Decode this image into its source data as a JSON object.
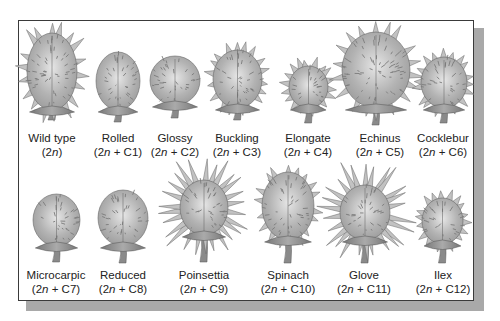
{
  "figure": {
    "colors": {
      "frame_border": "#3a3a3a",
      "shadow": "#a9a9a9",
      "pod_fill": "#9a9a9a",
      "pod_highlight": "#e6e6e6",
      "spine": "#7a7a7a",
      "stem": "#8a8a8a"
    },
    "rows": [
      {
        "items": [
          {
            "name": "Wild type",
            "karyotype_prefix": "(2",
            "karyotype_n": "n",
            "karyotype_suffix": ")",
            "x": 52,
            "body": [
              27,
              33,
              77,
              110
            ],
            "spiny": "large",
            "stem_to": 120
          },
          {
            "name": "Rolled",
            "karyotype_prefix": "(2",
            "karyotype_n": "n",
            "karyotype_suffix": " + C1)",
            "x": 118,
            "body": [
              96,
              52,
              140,
              110
            ],
            "spiny": "small",
            "stem_to": 122
          },
          {
            "name": "Glossy",
            "karyotype_prefix": "(2",
            "karyotype_n": "n",
            "karyotype_suffix": " + C2)",
            "x": 175,
            "body": [
              150,
              56,
              200,
              105
            ],
            "spiny": "small",
            "stem_to": 118
          },
          {
            "name": "Buckling",
            "karyotype_prefix": "(2",
            "karyotype_n": "n",
            "karyotype_suffix": " + C3)",
            "x": 237,
            "body": [
              213,
              50,
              262,
              108
            ],
            "spiny": "medium",
            "stem_to": 120
          },
          {
            "name": "Elongate",
            "karyotype_prefix": "(2",
            "karyotype_n": "n",
            "karyotype_suffix": " + C4)",
            "x": 308,
            "body": [
              289,
              66,
              328,
              108
            ],
            "spiny": "medium",
            "stem_to": 123
          },
          {
            "name": "Echinus",
            "karyotype_prefix": "(2",
            "karyotype_n": "n",
            "karyotype_suffix": " + C5)",
            "x": 380,
            "body": [
              342,
              32,
              410,
              108
            ],
            "spiny": "large",
            "stem_to": 125
          },
          {
            "name": "Cocklebur",
            "karyotype_prefix": "(2",
            "karyotype_n": "n",
            "karyotype_suffix": " + C6)",
            "x": 443,
            "body": [
              421,
              57,
              467,
              108
            ],
            "spiny": "medium",
            "stem_to": 123
          }
        ]
      },
      {
        "items": [
          {
            "name": "Microcarpic",
            "karyotype_prefix": "(2",
            "karyotype_n": "n",
            "karyotype_suffix": " + C7)",
            "x": 56,
            "body": [
              33,
              194,
              80,
              246
            ],
            "spiny": "small",
            "stem_to": 262
          },
          {
            "name": "Reduced",
            "karyotype_prefix": "(2",
            "karyotype_n": "n",
            "karyotype_suffix": " + C8)",
            "x": 123,
            "body": [
              98,
              190,
              148,
              246
            ],
            "spiny": "small",
            "stem_to": 263
          },
          {
            "name": "Poinsettia",
            "karyotype_prefix": "(2",
            "karyotype_n": "n",
            "karyotype_suffix": " + C9)",
            "x": 204,
            "body": [
              180,
              180,
              228,
              235
            ],
            "spiny": "huge",
            "stem_to": 262
          },
          {
            "name": "Spinach",
            "karyotype_prefix": "(2",
            "karyotype_n": "n",
            "karyotype_suffix": " + C10)",
            "x": 288,
            "body": [
              262,
              172,
              314,
              240
            ],
            "spiny": "medium",
            "stem_to": 263
          },
          {
            "name": "Glove",
            "karyotype_prefix": "(2",
            "karyotype_n": "n",
            "karyotype_suffix": " + C11)",
            "x": 364,
            "body": [
              340,
              185,
              390,
              240
            ],
            "spiny": "huge",
            "stem_to": 263
          },
          {
            "name": "Ilex",
            "karyotype_prefix": "(2",
            "karyotype_n": "n",
            "karyotype_suffix": " + C12)",
            "x": 443,
            "body": [
              422,
              198,
              463,
              244
            ],
            "spiny": "medium",
            "stem_to": 263
          }
        ]
      }
    ],
    "label_rows_y": [
      131,
      268
    ]
  }
}
